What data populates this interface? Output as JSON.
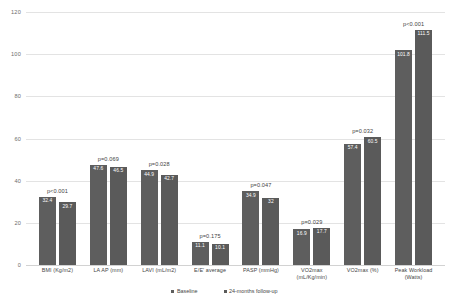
{
  "chart_data": {
    "type": "bar",
    "title": "",
    "xlabel": "",
    "ylabel": "",
    "ylim": [
      0,
      120
    ],
    "yticks": [
      "0",
      "20",
      "40",
      "60",
      "80",
      "100",
      "120"
    ],
    "grid": true,
    "legend_position": "bottom",
    "categories": [
      "BMI (Kg/m2)",
      "LA AP (mm)",
      "LAVI (mL/m2)",
      "E/E' average",
      "PASP (mmHg)",
      "VO2max (mL/Kg/min)",
      "VO2max (%)",
      "Peak Workload (Watts)"
    ],
    "series": [
      {
        "name": "Baseline",
        "values": [
          32.4,
          47.6,
          44.9,
          11.1,
          34.9,
          16.9,
          57.4,
          101.8
        ],
        "labels": [
          "32.4",
          "47.6",
          "44.9",
          "11.1",
          "34.9",
          "16.9",
          "57.4",
          "101.8"
        ],
        "color": "#5e5e5e"
      },
      {
        "name": "24-months follow-up",
        "values": [
          29.7,
          46.5,
          42.7,
          10.1,
          32.0,
          17.7,
          60.5,
          111.5
        ],
        "labels": [
          "29.7",
          "46.5",
          "42.7",
          "10.1",
          "32",
          "17.7",
          "60.5",
          "111.5"
        ],
        "color": "#5a5a5a"
      }
    ],
    "annotations": [
      "p<0.001",
      "p=0.069",
      "p=0.028",
      "p=0.175",
      "p=0.047",
      "p=0.029",
      "p=0.032",
      "p<0.001"
    ]
  },
  "legend": {
    "items": [
      {
        "label": "Baseline"
      },
      {
        "label": "24-months follow-up"
      }
    ]
  },
  "x_labels": [
    "BMI (Kg/m2)",
    "LA AP (mm)",
    "LAVI (mL/m2)",
    "E/E' average",
    "PASP (mmHg)",
    "VO2max (mL/Kg/min)",
    "VO2max (%)",
    "Peak Workload (Watts)"
  ]
}
